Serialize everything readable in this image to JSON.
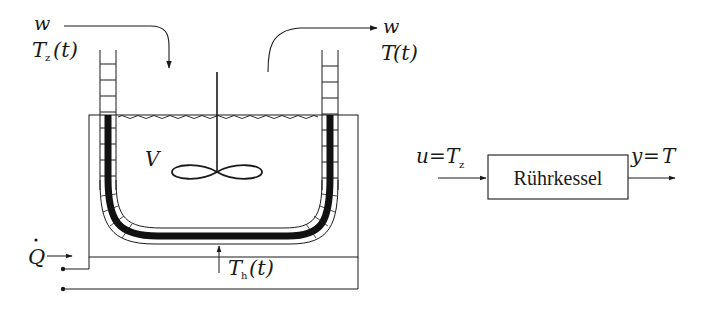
{
  "diagram": {
    "type": "process-schematic",
    "left_panel": {
      "inflow": {
        "flow_label": "w",
        "temp_label": "T",
        "temp_sub": "z",
        "temp_arg": "(t)"
      },
      "outflow": {
        "flow_label": "w",
        "temp_label": "T",
        "temp_arg": "(t)"
      },
      "volume_label": "V",
      "heat_input": {
        "label": "Q"
      },
      "heater_temp": {
        "label": "T",
        "sub": "h",
        "arg": "(t)"
      }
    },
    "right_panel": {
      "block_label": "Rührkessel",
      "input_label": {
        "lhs": "u",
        "eq": "=",
        "rhs": "T",
        "sub": "z"
      },
      "output_label": {
        "lhs": "y",
        "eq": "=",
        "rhs": "T"
      }
    },
    "colors": {
      "ink": "#1a1a1a",
      "background": "#ffffff"
    }
  }
}
